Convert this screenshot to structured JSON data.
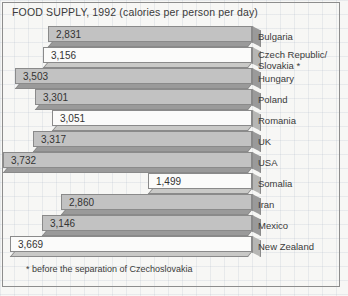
{
  "title": "FOOD SUPPLY, 1992 (calories per person per day)",
  "footnote": {
    "marker": "*",
    "text": "before the separation of Czechoslovakia"
  },
  "colors": {
    "background": "#f7f7f5",
    "grid": "#96a5b9",
    "bar_light": "#fbfbfa",
    "bar_dark": "#c2c2c2",
    "bar_outline": "#8a8a8a",
    "bevel": "#9a9a9a",
    "text": "#3a3a3a",
    "frame": "#8d8d8d"
  },
  "chart_data": {
    "type": "bar",
    "orientation": "horizontal",
    "title": "FOOD SUPPLY, 1992 (calories per person per day)",
    "xlabel": "calories per person per day",
    "ylabel": "",
    "xlim": [
      0,
      3732
    ],
    "grid": true,
    "legend": "none",
    "note": "Bars are right-aligned to a common end; length encodes value. Fills alternate light/dark.",
    "categories": [
      "Bulgaria",
      "Czech Republic/ Slovakia *",
      "Hungary",
      "Poland",
      "Romania",
      "UK",
      "USA",
      "Somalia",
      "Iran",
      "Mexico",
      "New Zealand"
    ],
    "values": [
      2831,
      3156,
      3503,
      3301,
      3051,
      3317,
      3732,
      1499,
      2860,
      3146,
      3669
    ],
    "value_labels": [
      "2,831",
      "3,156",
      "3,503",
      "3,301",
      "3,051",
      "3,317",
      "3,732",
      "1,499",
      "2,860",
      "3,146",
      "3,669"
    ]
  },
  "bars": [
    {
      "label": "Bulgaria",
      "label2": "",
      "value_label": "2,831",
      "shade": "dark",
      "left": 48,
      "top": 0
    },
    {
      "label": "Czech Republic/",
      "label2": "Slovakia *",
      "value_label": "3,156",
      "shade": "light",
      "left": 43,
      "top": 21
    },
    {
      "label": "Hungary",
      "label2": "",
      "value_label": "3,503",
      "shade": "dark",
      "left": 15,
      "top": 42
    },
    {
      "label": "Poland",
      "label2": "",
      "value_label": "3,301",
      "shade": "dark",
      "left": 35,
      "top": 63
    },
    {
      "label": "Romania",
      "label2": "",
      "value_label": "3,051",
      "shade": "light",
      "left": 52,
      "top": 84
    },
    {
      "label": "UK",
      "label2": "",
      "value_label": "3,317",
      "shade": "dark",
      "left": 33,
      "top": 105
    },
    {
      "label": "USA",
      "label2": "",
      "value_label": "3,732",
      "shade": "dark",
      "left": 3,
      "top": 126
    },
    {
      "label": "Somalia",
      "label2": "",
      "value_label": "1,499",
      "shade": "light",
      "left": 148,
      "top": 147
    },
    {
      "label": "Iran",
      "label2": "",
      "value_label": "2,860",
      "shade": "dark",
      "left": 61,
      "top": 168
    },
    {
      "label": "Mexico",
      "label2": "",
      "value_label": "3,146",
      "shade": "dark",
      "left": 42,
      "top": 189
    },
    {
      "label": "New Zealand",
      "label2": "",
      "value_label": "3,669",
      "shade": "light",
      "left": 10,
      "top": 210
    }
  ]
}
